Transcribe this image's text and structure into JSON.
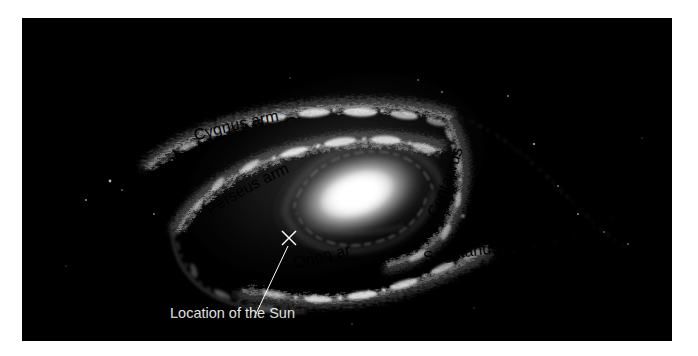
{
  "figure": {
    "background_color": "#000000",
    "page_color": "#ffffff",
    "label_color": "#f2f2f2",
    "panel": {
      "x": 22,
      "y": 18,
      "width": 650,
      "height": 323
    }
  },
  "labels": {
    "cygnus": "Cygnus arm",
    "perseus": "Perseus arm",
    "centaurus": "Centaurus arm",
    "sagittarius": "Sagittarius arm",
    "orion": "Orion arm",
    "sun": "Location of the Sun"
  },
  "markers": {
    "sun_marker": "×",
    "sun_marker_x": 267,
    "sun_marker_y": 220
  },
  "chart_data": {
    "type": "diagram",
    "core": {
      "cx": 335,
      "cy": 175,
      "rx": 62,
      "ry": 37,
      "tilt_deg": -18,
      "color": "#ffffff"
    },
    "annotations": [
      {
        "label": "Cygnus arm",
        "x": 205,
        "y": 115,
        "rotation_deg": -11
      },
      {
        "label": "Perseus arm",
        "x": 212,
        "y": 186,
        "rotation_deg": -38
      },
      {
        "label": "Centaurus arm",
        "x": 430,
        "y": 196,
        "rotation_deg": -72
      },
      {
        "label": "Sagittarius arm",
        "x": 408,
        "y": 240,
        "rotation_deg": -7
      },
      {
        "label": "Orion arm",
        "x": 274,
        "y": 247,
        "rotation_deg": -12
      },
      {
        "label": "Location of the Sun",
        "x": 170,
        "y": 312,
        "rotation_deg": 0
      }
    ],
    "leader_line": {
      "x1": 267,
      "y1": 226,
      "x2": 232,
      "y2": 300
    },
    "arm_count": 5,
    "arm_names": [
      "Cygnus arm",
      "Perseus arm",
      "Centaurus arm",
      "Sagittarius arm",
      "Orion arm"
    ]
  }
}
